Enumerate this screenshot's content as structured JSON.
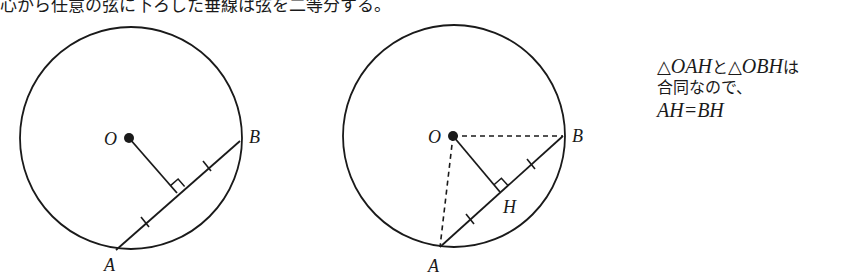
{
  "caption": "心から任意の弦に下ろした垂線は弦を二等分する。",
  "figure_left": {
    "labels": {
      "center": "O",
      "a": "A",
      "b": "B"
    },
    "circle": {
      "cx": 131,
      "cy": 138,
      "r": 111
    },
    "points": {
      "O": [
        129,
        138
      ],
      "A": [
        116,
        250
      ],
      "B": [
        240,
        141
      ],
      "H": [
        177,
        193
      ]
    },
    "marks": [
      "right-angle at foot",
      "equal tick on AH",
      "equal tick on HB"
    ]
  },
  "figure_right": {
    "labels": {
      "center": "O",
      "a": "A",
      "b": "B",
      "foot": "H"
    },
    "circle": {
      "cx": 454,
      "cy": 136,
      "r": 111
    },
    "points": {
      "O": [
        453,
        136
      ],
      "A": [
        440,
        247
      ],
      "B": [
        563,
        136
      ],
      "H": [
        500,
        192
      ]
    },
    "dashed_segments": [
      "OA",
      "OB"
    ],
    "marks": [
      "right-angle at H",
      "equal tick on AH",
      "equal tick on HB"
    ]
  },
  "note": {
    "tri1_symbol": "△",
    "tri1": "OAH",
    "and": "と",
    "tri2_symbol": "△",
    "tri2": "OBH",
    "topic": "は",
    "line2": "合同なので、",
    "line3": "AH=BH"
  },
  "colors": {
    "ink": "#1a1a1a",
    "background": "#ffffff"
  }
}
